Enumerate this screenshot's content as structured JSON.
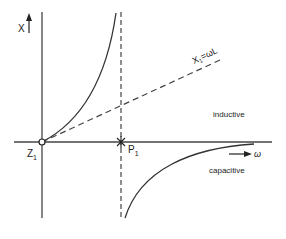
{
  "diagram": {
    "y_axis_label": "X",
    "x_axis_label": "ω",
    "zero_label": "Z",
    "zero_subscript": "1",
    "pole_label": "P",
    "pole_subscript": "1",
    "asymptote_label": "X",
    "asymptote_subscript": "1",
    "asymptote_rhs": "=ωL",
    "region_upper": "inductive",
    "region_lower": "capacitive",
    "line_color": "#333333"
  }
}
